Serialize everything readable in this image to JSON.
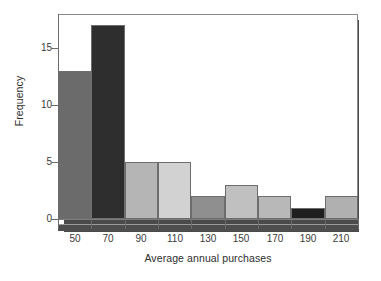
{
  "chart_data": {
    "type": "bar",
    "title": "",
    "subtitle": "",
    "xlabel": "Average annual purchases",
    "ylabel": "Frequency",
    "categories": [
      "50",
      "70",
      "90",
      "110",
      "130",
      "150",
      "170",
      "190",
      "210"
    ],
    "values": [
      13,
      17,
      5,
      5,
      2,
      3,
      2,
      1,
      2
    ],
    "bar_colors": [
      "#6b6b6b",
      "#2e2e2e",
      "#b5b5b5",
      "#d2d2d2",
      "#8f8f8f",
      "#c0c0c0",
      "#b8b8b8",
      "#1f1f1f",
      "#b0b0b0"
    ],
    "xlim": [
      40,
      220
    ],
    "ylim": [
      0,
      18
    ],
    "xtick_labels": [
      "50",
      "70",
      "90",
      "110",
      "130",
      "150",
      "170",
      "190",
      "210"
    ],
    "xtick_values": [
      50,
      70,
      90,
      110,
      130,
      150,
      170,
      190,
      210
    ],
    "ytick_labels": [
      "0",
      "5",
      "10",
      "15"
    ],
    "ytick_values": [
      0,
      5,
      10,
      15
    ],
    "grid": false,
    "legend": null,
    "bin_width": 20
  },
  "axes": {
    "y_title": "Frequency",
    "x_title": "Average annual purchases"
  }
}
